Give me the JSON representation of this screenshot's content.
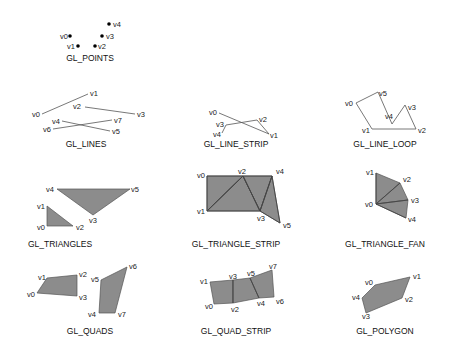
{
  "figure": {
    "primitives": [
      {
        "name": "GL_POINTS",
        "title_pos": [
          90,
          61
        ],
        "type": "points",
        "vertices": [
          {
            "label": "v0",
            "x": 70,
            "y": 36,
            "lx": 60,
            "ly": 39
          },
          {
            "label": "v1",
            "x": 78,
            "y": 46,
            "lx": 67,
            "ly": 49
          },
          {
            "label": "v2",
            "x": 95,
            "y": 46,
            "lx": 98,
            "ly": 49
          },
          {
            "label": "v3",
            "x": 102,
            "y": 36,
            "lx": 106,
            "ly": 39
          },
          {
            "label": "v4",
            "x": 109,
            "y": 24,
            "lx": 113,
            "ly": 27
          }
        ]
      },
      {
        "name": "GL_LINES",
        "title_pos": [
          86,
          147
        ],
        "type": "lines",
        "vertices": [
          {
            "label": "v0",
            "x": 42,
            "y": 114,
            "lx": 32,
            "ly": 117
          },
          {
            "label": "v1",
            "x": 88,
            "y": 94,
            "lx": 90,
            "ly": 96
          },
          {
            "label": "v2",
            "x": 85,
            "y": 107,
            "lx": 73,
            "ly": 109
          },
          {
            "label": "v3",
            "x": 135,
            "y": 114,
            "lx": 137,
            "ly": 117
          },
          {
            "label": "v4",
            "x": 62,
            "y": 121,
            "lx": 52,
            "ly": 124
          },
          {
            "label": "v5",
            "x": 110,
            "y": 131,
            "lx": 112,
            "ly": 134
          },
          {
            "label": "v6",
            "x": 53,
            "y": 129,
            "lx": 43,
            "ly": 132
          },
          {
            "label": "v7",
            "x": 112,
            "y": 120,
            "lx": 114,
            "ly": 123
          }
        ],
        "segments": [
          [
            0,
            1
          ],
          [
            2,
            3
          ],
          [
            4,
            5
          ],
          [
            6,
            7
          ]
        ]
      },
      {
        "name": "GL_LINE_STRIP",
        "title_pos": [
          236,
          147
        ],
        "type": "line_strip",
        "vertices": [
          {
            "label": "v0",
            "x": 219,
            "y": 113,
            "lx": 209,
            "ly": 115
          },
          {
            "label": "v1",
            "x": 269,
            "y": 134,
            "lx": 270,
            "ly": 138
          },
          {
            "label": "v2",
            "x": 257,
            "y": 120,
            "lx": 259,
            "ly": 122
          },
          {
            "label": "v3",
            "x": 226,
            "y": 125,
            "lx": 216,
            "ly": 127
          },
          {
            "label": "v4",
            "x": 222,
            "y": 133,
            "lx": 213,
            "ly": 137
          }
        ]
      },
      {
        "name": "GL_LINE_LOOP",
        "title_pos": [
          385,
          147
        ],
        "type": "line_loop",
        "vertices": [
          {
            "label": "v0",
            "x": 356,
            "y": 103,
            "lx": 345,
            "ly": 106
          },
          {
            "label": "v1",
            "x": 372,
            "y": 129,
            "lx": 362,
            "ly": 133
          },
          {
            "label": "v2",
            "x": 416,
            "y": 129,
            "lx": 418,
            "ly": 133
          },
          {
            "label": "v3",
            "x": 405,
            "y": 105,
            "lx": 408,
            "ly": 110
          },
          {
            "label": "v4",
            "x": 392,
            "y": 124,
            "lx": 385,
            "ly": 119
          },
          {
            "label": "v5",
            "x": 378,
            "y": 92,
            "lx": 379,
            "ly": 96
          }
        ]
      },
      {
        "name": "GL_TRIANGLES",
        "title_pos": [
          60,
          247
        ],
        "type": "triangles",
        "vertices": [
          {
            "label": "v0",
            "x": 47,
            "y": 226,
            "lx": 37,
            "ly": 230
          },
          {
            "label": "v1",
            "x": 47,
            "y": 206,
            "lx": 37,
            "ly": 209
          },
          {
            "label": "v2",
            "x": 73,
            "y": 226,
            "lx": 76,
            "ly": 230
          },
          {
            "label": "v3",
            "x": 93,
            "y": 215,
            "lx": 89,
            "ly": 223
          },
          {
            "label": "v4",
            "x": 57,
            "y": 189,
            "lx": 46,
            "ly": 192
          },
          {
            "label": "v5",
            "x": 130,
            "y": 189,
            "lx": 131,
            "ly": 192
          }
        ],
        "triangles": [
          [
            0,
            1,
            2
          ],
          [
            3,
            4,
            5
          ]
        ]
      },
      {
        "name": "GL_TRIANGLE_STRIP",
        "title_pos": [
          236,
          247
        ],
        "type": "triangle_strip",
        "vertices": [
          {
            "label": "v0",
            "x": 207,
            "y": 176,
            "lx": 197,
            "ly": 178
          },
          {
            "label": "v1",
            "x": 207,
            "y": 211,
            "lx": 197,
            "ly": 214
          },
          {
            "label": "v2",
            "x": 243,
            "y": 176,
            "lx": 238,
            "ly": 174
          },
          {
            "label": "v3",
            "x": 260,
            "y": 211,
            "lx": 257,
            "ly": 221
          },
          {
            "label": "v4",
            "x": 272,
            "y": 176,
            "lx": 276,
            "ly": 174
          },
          {
            "label": "v5",
            "x": 280,
            "y": 223,
            "lx": 283,
            "ly": 228
          }
        ]
      },
      {
        "name": "GL_TRIANGLE_FAN",
        "title_pos": [
          385,
          247
        ],
        "type": "triangle_fan",
        "vertices": [
          {
            "label": "v0",
            "x": 376,
            "y": 204,
            "lx": 365,
            "ly": 207
          },
          {
            "label": "v1",
            "x": 376,
            "y": 173,
            "lx": 366,
            "ly": 175
          },
          {
            "label": "v2",
            "x": 400,
            "y": 183,
            "lx": 403,
            "ly": 182
          },
          {
            "label": "v3",
            "x": 408,
            "y": 200,
            "lx": 411,
            "ly": 203
          },
          {
            "label": "v4",
            "x": 406,
            "y": 218,
            "lx": 408,
            "ly": 222
          }
        ]
      },
      {
        "name": "GL_QUADS",
        "title_pos": [
          90,
          334
        ],
        "type": "quads",
        "vertices": [
          {
            "label": "v0",
            "x": 37,
            "y": 293,
            "lx": 27,
            "ly": 297
          },
          {
            "label": "v1",
            "x": 47,
            "y": 278,
            "lx": 38,
            "ly": 280
          },
          {
            "label": "v2",
            "x": 77,
            "y": 275,
            "lx": 79,
            "ly": 277
          },
          {
            "label": "v3",
            "x": 77,
            "y": 296,
            "lx": 79,
            "ly": 300
          },
          {
            "label": "v4",
            "x": 99,
            "y": 313,
            "lx": 88,
            "ly": 317
          },
          {
            "label": "v5",
            "x": 101,
            "y": 280,
            "lx": 91,
            "ly": 282
          },
          {
            "label": "v6",
            "x": 127,
            "y": 267,
            "lx": 129,
            "ly": 269
          },
          {
            "label": "v7",
            "x": 115,
            "y": 313,
            "lx": 118,
            "ly": 317
          }
        ],
        "quads": [
          [
            0,
            1,
            2,
            3
          ],
          [
            4,
            5,
            6,
            7
          ]
        ]
      },
      {
        "name": "GL_QUAD_STRIP",
        "title_pos": [
          236,
          334
        ],
        "type": "quad_strip",
        "vertices": [
          {
            "label": "v0",
            "x": 214,
            "y": 304,
            "lx": 205,
            "ly": 309
          },
          {
            "label": "v1",
            "x": 210,
            "y": 282,
            "lx": 200,
            "ly": 284
          },
          {
            "label": "v2",
            "x": 233,
            "y": 303,
            "lx": 231,
            "ly": 312
          },
          {
            "label": "v3",
            "x": 233,
            "y": 280,
            "lx": 229,
            "ly": 279
          },
          {
            "label": "v4",
            "x": 259,
            "y": 298,
            "lx": 257,
            "ly": 306
          },
          {
            "label": "v5",
            "x": 250,
            "y": 278,
            "lx": 247,
            "ly": 276
          },
          {
            "label": "v6",
            "x": 274,
            "y": 297,
            "lx": 276,
            "ly": 304
          },
          {
            "label": "v7",
            "x": 272,
            "y": 270,
            "lx": 269,
            "ly": 269
          }
        ]
      },
      {
        "name": "GL_POLYGON",
        "title_pos": [
          385,
          334
        ],
        "type": "polygon",
        "vertices": [
          {
            "label": "v0",
            "x": 375,
            "y": 285,
            "lx": 365,
            "ly": 285
          },
          {
            "label": "v1",
            "x": 410,
            "y": 277,
            "lx": 413,
            "ly": 279
          },
          {
            "label": "v2",
            "x": 402,
            "y": 298,
            "lx": 405,
            "ly": 302
          },
          {
            "label": "v3",
            "x": 366,
            "y": 313,
            "lx": 362,
            "ly": 319
          },
          {
            "label": "v4",
            "x": 362,
            "y": 298,
            "lx": 352,
            "ly": 300
          }
        ]
      }
    ]
  }
}
